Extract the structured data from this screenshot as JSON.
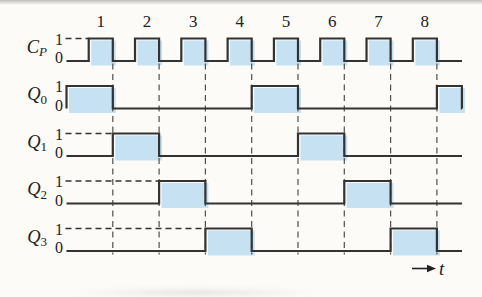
{
  "diagram": {
    "type": "timing-diagram",
    "colors": {
      "signal_fill": "#c6e1f1",
      "signal_stroke": "#333333",
      "dashed_line": "#4f4f4f",
      "text": "#222222",
      "background": "#fcfbf8"
    },
    "levels": {
      "high_label": "1",
      "low_label": "0"
    },
    "time_label": "t",
    "clock": {
      "label_main": "C",
      "label_sub": "P",
      "pulse_numbers": [
        "1",
        "2",
        "3",
        "4",
        "5",
        "6",
        "7",
        "8"
      ],
      "high_intervals": [
        [
          0.48,
          1
        ],
        [
          1.48,
          2
        ],
        [
          2.48,
          3
        ],
        [
          3.48,
          4
        ],
        [
          4.48,
          5
        ],
        [
          5.48,
          6
        ],
        [
          6.48,
          7
        ],
        [
          7.48,
          8
        ]
      ]
    },
    "signals": [
      {
        "label_main": "Q",
        "label_sub": "0",
        "high_intervals": [
          [
            0,
            1
          ],
          [
            4,
            5
          ],
          [
            8,
            8.54
          ]
        ]
      },
      {
        "label_main": "Q",
        "label_sub": "1",
        "high_intervals": [
          [
            1,
            2
          ],
          [
            5,
            6
          ]
        ]
      },
      {
        "label_main": "Q",
        "label_sub": "2",
        "high_intervals": [
          [
            2,
            3
          ],
          [
            6,
            7
          ]
        ]
      },
      {
        "label_main": "Q",
        "label_sub": "3",
        "high_intervals": [
          [
            3,
            4
          ],
          [
            7,
            8
          ]
        ]
      }
    ],
    "grid_lines_at": [
      1,
      2,
      3,
      4,
      5,
      6,
      7,
      8
    ]
  }
}
